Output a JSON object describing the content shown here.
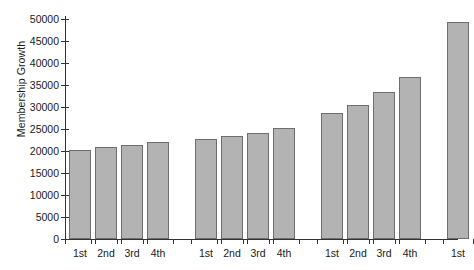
{
  "chart_data": {
    "type": "bar",
    "title": "",
    "xlabel": "",
    "ylabel": "Membership Growth",
    "ylim": [
      0,
      50000
    ],
    "ytick_step": 5000,
    "yticks": [
      0,
      5000,
      10000,
      15000,
      20000,
      25000,
      30000,
      35000,
      40000,
      45000,
      50000
    ],
    "ytick_labels": [
      "0",
      "5000",
      "10000",
      "15000",
      "20000",
      "25000",
      "30000",
      "35000",
      "40000",
      "45000",
      "50000"
    ],
    "grid": false,
    "legend": false,
    "bar_color": "#b3b3b3",
    "bar_edge_color": "#6e6e6e",
    "axis_color": "#333333",
    "categories": [
      "1st",
      "2nd",
      "3rd",
      "4th",
      "1st",
      "2nd",
      "3rd",
      "4th",
      "1st",
      "2nd",
      "3rd",
      "4th",
      "1st"
    ],
    "values": [
      20200,
      20900,
      21400,
      22100,
      22700,
      23400,
      24200,
      25200,
      28700,
      30500,
      33500,
      36800,
      49400
    ],
    "group_breaks": [
      4,
      8,
      12
    ],
    "groups": [
      {
        "labels": [
          "1st",
          "2nd",
          "3rd",
          "4th"
        ],
        "values": [
          20200,
          20900,
          21400,
          22100
        ]
      },
      {
        "labels": [
          "1st",
          "2nd",
          "3rd",
          "4th"
        ],
        "values": [
          22700,
          23400,
          24200,
          25200
        ]
      },
      {
        "labels": [
          "1st",
          "2nd",
          "3rd",
          "4th"
        ],
        "values": [
          28700,
          30500,
          33500,
          36800
        ]
      },
      {
        "labels": [
          "1st"
        ],
        "values": [
          49400
        ]
      }
    ]
  }
}
